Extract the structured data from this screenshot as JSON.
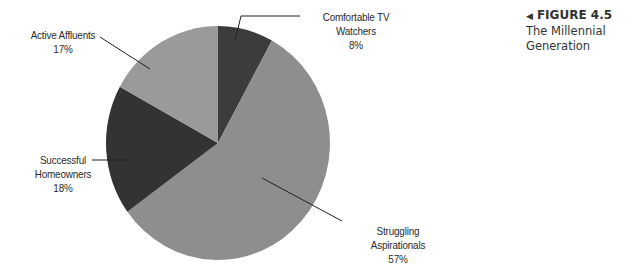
{
  "caption": {
    "arrow": "◀",
    "figure_label": "FIGURE 4.5",
    "figure_title": "The Millennial Generation"
  },
  "labels": {
    "comfortable": {
      "name": "Comfortable TV Watchers",
      "pct": "8%"
    },
    "active": {
      "name": "Active Affluents",
      "pct": "17%"
    },
    "successful": {
      "line1": "Successful",
      "line2": "Homeowners",
      "pct": "18%"
    },
    "struggling": {
      "name": "Struggling Aspirationals",
      "pct": "57%"
    }
  },
  "colors": {
    "comfortable": "#3c3c3c",
    "struggling": "#8e8e8e",
    "successful": "#333333",
    "active": "#9a9a9a",
    "leader": "#222222"
  },
  "chart_data": {
    "type": "pie",
    "title": "The Millennial Generation",
    "figure": "FIGURE 4.5",
    "categories": [
      "Comfortable TV Watchers",
      "Struggling Aspirationals",
      "Successful Homeowners",
      "Active Affluents"
    ],
    "values": [
      8,
      57,
      18,
      17
    ],
    "units": "%",
    "start_angle_deg_clockwise_from_top": 0,
    "direction": "clockwise",
    "legend": "none (direct labels with leader lines)"
  }
}
